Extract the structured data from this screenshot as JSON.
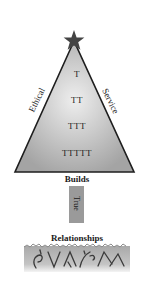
{
  "diagram": {
    "top_icon": "star-icon",
    "canopy": {
      "left_label": "Ethical",
      "right_label": "Service",
      "rows": [
        "T",
        "TT",
        "TTT",
        "TTTTT"
      ]
    },
    "connector_label": "Builds",
    "trunk_label": "True",
    "base_label": "Relationships",
    "roots_icon": "roots-icon",
    "colors": {
      "star": "#444444",
      "canopy_light": "#e8e8e8",
      "canopy_dark": "#a8a8a8",
      "outline": "#1e1e1e",
      "trunk": "#9a9a9a",
      "roots_band": "#b9b9b9",
      "roots_lines": "#3a3a3a"
    }
  }
}
